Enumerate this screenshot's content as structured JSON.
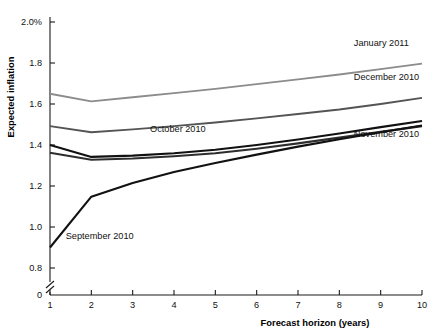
{
  "chart_data": {
    "type": "line",
    "title": "",
    "xlabel": "Forecast horizon (years)",
    "ylabel": "Expected inflation",
    "x": [
      1,
      2,
      3,
      4,
      5,
      6,
      7,
      8,
      9,
      10
    ],
    "xlim": [
      1,
      10
    ],
    "ylim": [
      0.8,
      2.0
    ],
    "axis_break": true,
    "axis_break_note": "y-axis broken between 0 and 0.8",
    "grid": false,
    "legend_position": "inline-labels",
    "xticks": [
      "1",
      "2",
      "3",
      "4",
      "5",
      "6",
      "7",
      "8",
      "9",
      "10"
    ],
    "yticks": [
      "0",
      "0.8",
      "1.0",
      "1.2",
      "1.4",
      "1.6",
      "1.8",
      "2.0%"
    ],
    "ytick_values": [
      0,
      0.8,
      1.0,
      1.2,
      1.4,
      1.6,
      1.8,
      2.0
    ],
    "series": [
      {
        "name": "January 2011",
        "color": "#8c8c8c",
        "width": 1.9,
        "label_x": 8.35,
        "label_y": 1.885,
        "values": [
          1.65,
          1.613,
          1.633,
          1.653,
          1.674,
          1.697,
          1.72,
          1.744,
          1.77,
          1.797
        ]
      },
      {
        "name": "December 2010",
        "color": "#545454",
        "width": 1.9,
        "label_x": 8.35,
        "label_y": 1.718,
        "values": [
          1.492,
          1.462,
          1.476,
          1.492,
          1.51,
          1.53,
          1.551,
          1.573,
          1.6,
          1.63
        ]
      },
      {
        "name": "November 2010",
        "color": "#111111",
        "width": 2.1,
        "label_x": 8.35,
        "label_y": 1.438,
        "values": [
          1.4,
          1.342,
          1.348,
          1.36,
          1.377,
          1.4,
          1.427,
          1.456,
          1.487,
          1.517
        ]
      },
      {
        "name": "October 2010",
        "color": "#2e2e2e",
        "width": 2.1,
        "label_x": 3.42,
        "label_y": 1.462,
        "values": [
          1.362,
          1.328,
          1.334,
          1.345,
          1.36,
          1.382,
          1.408,
          1.436,
          1.464,
          1.492
        ]
      },
      {
        "name": "September 2010",
        "color": "#111111",
        "width": 2.1,
        "label_x": 1.38,
        "label_y": 0.942,
        "values": [
          0.9,
          1.148,
          1.215,
          1.268,
          1.312,
          1.353,
          1.392,
          1.428,
          1.462,
          1.495
        ]
      }
    ]
  }
}
